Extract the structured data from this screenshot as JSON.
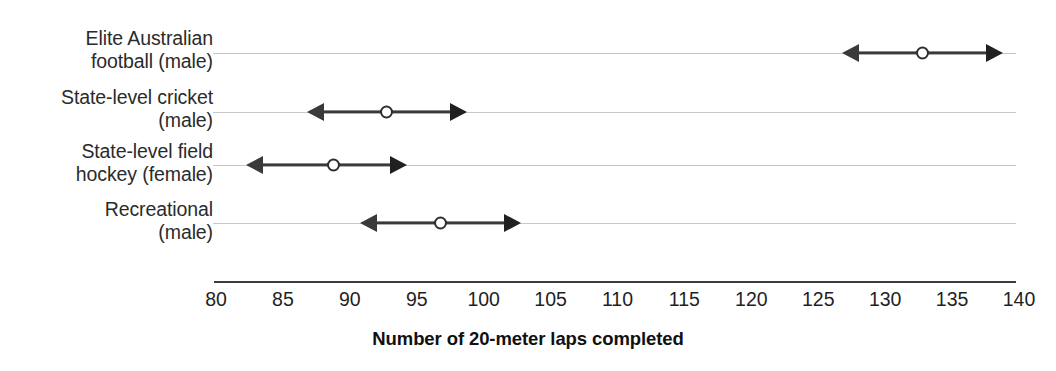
{
  "chart_data": {
    "type": "scatter",
    "title": "",
    "xlabel": "Number of 20-meter laps completed",
    "ylabel": "",
    "xlim": [
      80,
      140
    ],
    "xticks": [
      80,
      85,
      90,
      95,
      100,
      105,
      110,
      115,
      120,
      125,
      130,
      135,
      140
    ],
    "xtick_labels": [
      "80",
      "85",
      "90",
      "95",
      "100",
      "105",
      "110",
      "115",
      "120",
      "125",
      "130",
      "135",
      "140"
    ],
    "grid": true,
    "legend": "none",
    "categories": [
      "Elite Australian\nfootball (male)",
      "State-level cricket\n(male)",
      "State-level field\nhockey (female)",
      "Recreational\n(male)"
    ],
    "series": [
      {
        "name": "mean",
        "values": [
          133,
          93,
          89,
          97
        ]
      },
      {
        "name": "range_low",
        "values": [
          127,
          87,
          82.5,
          91
        ]
      },
      {
        "name": "range_high",
        "values": [
          139,
          99,
          94.5,
          103
        ]
      }
    ],
    "points": [
      {
        "category": "Elite Australian football (male)",
        "value": 133,
        "low": 127,
        "high": 139
      },
      {
        "category": "State-level cricket (male)",
        "value": 93,
        "low": 87,
        "high": 99
      },
      {
        "category": "State-level field hockey (female)",
        "value": 89,
        "low": 82.5,
        "high": 94.5
      },
      {
        "category": "Recreational (male)",
        "value": 97,
        "low": 91,
        "high": 103
      }
    ],
    "colors": {
      "marker_fill": "#ffffff",
      "marker_edge": "#2e2e2e",
      "line": "#3a3a3a",
      "gridline": "#c8c8c8",
      "axis": "#3c3c3c",
      "text": "#1f1f1f"
    }
  },
  "axis": {
    "title": "Number of 20-meter laps completed"
  },
  "categories": [
    {
      "label": "Elite Australian\nfootball (male)"
    },
    {
      "label": "State-level cricket\n(male)"
    },
    {
      "label": "State-level field\nhockey (female)"
    },
    {
      "label": "Recreational\n(male)"
    }
  ],
  "ticks": [
    {
      "label": "80"
    },
    {
      "label": "85"
    },
    {
      "label": "90"
    },
    {
      "label": "95"
    },
    {
      "label": "100"
    },
    {
      "label": "105"
    },
    {
      "label": "110"
    },
    {
      "label": "115"
    },
    {
      "label": "120"
    },
    {
      "label": "125"
    },
    {
      "label": "130"
    },
    {
      "label": "135"
    },
    {
      "label": "140"
    }
  ]
}
